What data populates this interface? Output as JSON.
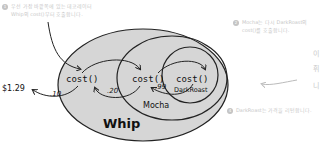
{
  "annotations": {
    "note1": {
      "number": "1",
      "line1": "우선 가장 바깥쪽에 있는 데코레이터",
      "line2": "Whip의 cost()부터 호출합니다."
    },
    "note2": {
      "number": "2",
      "line1": "Mocha는 다시 DarkRoast의",
      "line2": "cost()를 호출합니다."
    },
    "note4": {
      "number": "4",
      "line1": "DarkRoast는 가격을 리턴합니다."
    },
    "side_chars": [
      "이",
      "휘",
      "니"
    ]
  },
  "diagram": {
    "layers": [
      {
        "name": "Whip",
        "label": "Whip",
        "method": "cost()",
        "adds": ".10"
      },
      {
        "name": "Mocha",
        "label": "Mocha",
        "method": "cost()",
        "adds": ".20"
      },
      {
        "name": "DarkRoast",
        "label": "DarkRoast",
        "method": "cost()",
        "adds": ".99"
      }
    ],
    "result": "$1.29",
    "colors": {
      "fill": "#d6d6d6",
      "stroke": "#222222",
      "text": "#111111",
      "faded": "#c8c8c8"
    }
  }
}
